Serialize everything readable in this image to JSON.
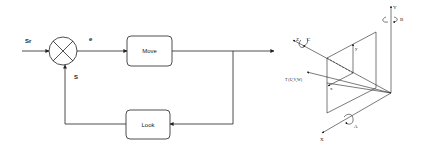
{
  "block_diagram": {
    "input_label": "Sr",
    "error_label": "e",
    "feedback_label": "S",
    "forward_block": "Move",
    "feedback_block": "Look"
  },
  "coordinate_frame": {
    "axes": {
      "x": "X",
      "y": "Y",
      "z": "Z"
    },
    "rotations": {
      "about_x": "A",
      "about_y": "B",
      "about_z": "C"
    },
    "image_axes": {
      "x": "x",
      "y": "y"
    },
    "point_label": "T (U,V,W)"
  },
  "colors": {
    "stroke": "#222222",
    "background": "#ffffff"
  }
}
